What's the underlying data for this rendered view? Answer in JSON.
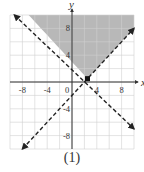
{
  "chart_data": {
    "type": "line",
    "title": "",
    "caption": "(1)",
    "xlabel": "x",
    "ylabel": "y",
    "xlim": [
      -10,
      10
    ],
    "ylim": [
      -10,
      10
    ],
    "grid": true,
    "grid_step": 2,
    "x_ticks": [
      -8,
      -4,
      0,
      4,
      8
    ],
    "x_tick_labels": [
      "-8",
      "-4",
      "0",
      "4",
      "8"
    ],
    "y_ticks": [
      8,
      4,
      -4,
      -8
    ],
    "y_tick_labels": [
      "8",
      "4",
      "-4",
      "-8"
    ],
    "series": [
      {
        "name": "boundary 1",
        "equation": "y = -x + 3",
        "style": "dashed",
        "points": [
          [
            -9,
            12
          ],
          [
            10,
            -7
          ]
        ],
        "arrows": true
      },
      {
        "name": "boundary 2",
        "equation": "y = x - 2",
        "style": "dashed",
        "points": [
          [
            -8,
            -10
          ],
          [
            10,
            8
          ]
        ],
        "arrows": true
      }
    ],
    "shaded_region": {
      "description": "y > -x + 3 and y > x - 2",
      "color": "#b8b8b8"
    },
    "intersection_point": [
      2.5,
      0.5
    ],
    "colors": {
      "grid": "#d0d0d0",
      "axes": "#333333",
      "lines": "#222222",
      "shade": "#b8b8b8"
    }
  }
}
